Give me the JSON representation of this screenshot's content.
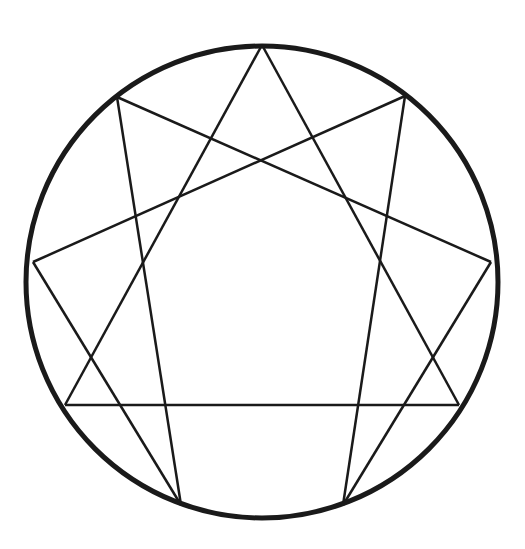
{
  "diagram": {
    "type": "enneagram",
    "circle": {
      "cx": 262,
      "cy": 282,
      "r": 236,
      "stroke": "#1a1a1a",
      "width": 5
    },
    "line_color": "#1a1a1a",
    "line_width": 2.5,
    "points": [
      {
        "id": "p9",
        "x": 262,
        "y": 45
      },
      {
        "id": "p1",
        "x": 405,
        "y": 96
      },
      {
        "id": "p2",
        "x": 491,
        "y": 262
      },
      {
        "id": "p3",
        "x": 459,
        "y": 405
      },
      {
        "id": "p4",
        "x": 343,
        "y": 505
      },
      {
        "id": "p5",
        "x": 181,
        "y": 505
      },
      {
        "id": "p6",
        "x": 65,
        "y": 405
      },
      {
        "id": "p7",
        "x": 33,
        "y": 262
      },
      {
        "id": "p8",
        "x": 117,
        "y": 97
      }
    ],
    "edges": [
      [
        "p9",
        "p3"
      ],
      [
        "p9",
        "p6"
      ],
      [
        "p3",
        "p6"
      ],
      [
        "p1",
        "p4"
      ],
      [
        "p4",
        "p2"
      ],
      [
        "p2",
        "p8"
      ],
      [
        "p8",
        "p5"
      ],
      [
        "p5",
        "p7"
      ],
      [
        "p7",
        "p1"
      ]
    ]
  }
}
